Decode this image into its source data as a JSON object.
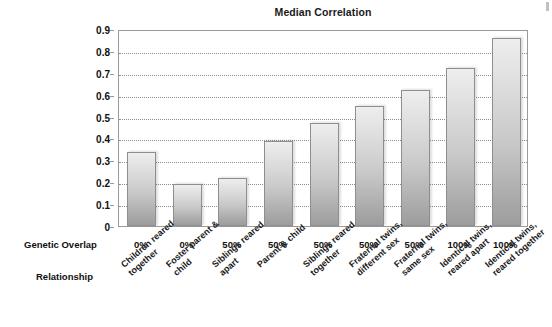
{
  "chart_data": {
    "type": "bar",
    "title": "Median Correlation",
    "xlabel": "",
    "ylabel": "",
    "ylim": [
      0,
      0.9
    ],
    "yticks": [
      "0",
      "0.1",
      "0.2",
      "0.3",
      "0.4",
      "0.5",
      "0.6",
      "0.7",
      "0.8",
      "0.9"
    ],
    "grid": true,
    "legend": false,
    "categories": [
      "Children reared together",
      "Foster parent & child",
      "Siblings reared apart",
      "Parent & child",
      "Siblings reared together",
      "Fraternal twins, different sex",
      "Fraternal twins, same sex",
      "Identical twins, reared apart",
      "Identical twins, reared together"
    ],
    "values": [
      0.34,
      0.19,
      0.22,
      0.39,
      0.47,
      0.55,
      0.62,
      0.72,
      0.86
    ],
    "bar_color": "#c9c9c9",
    "bar_border_color": "#8e8e8e"
  },
  "axis_rows": {
    "genetic_overlap_label": "Genetic Overlap",
    "relationship_label": "Relationship",
    "genetic_overlap_values": [
      "0%",
      "0%",
      "50%",
      "50%",
      "50%",
      "50%",
      "50%",
      "100%",
      "100%"
    ],
    "relationship_lines": [
      [
        "Children reared",
        "together"
      ],
      [
        "Foster parent &",
        "child"
      ],
      [
        "Siblings reared",
        "apart"
      ],
      [
        "Parent & child",
        ""
      ],
      [
        "Siblings reared",
        "together"
      ],
      [
        "Fraternal twins,",
        "different sex"
      ],
      [
        "Fraternal twins,",
        "same sex"
      ],
      [
        "Identical twins,",
        "reared apart"
      ],
      [
        "Identical twins,",
        "reared together"
      ]
    ]
  }
}
